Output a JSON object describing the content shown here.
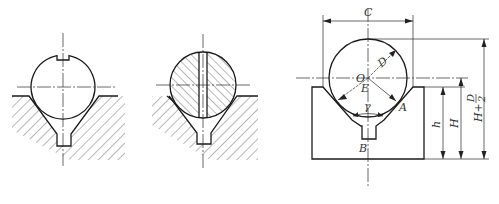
{
  "figure": {
    "views": [
      {
        "id": "view-1",
        "description": "Ball with top notch seated in V-groove fixture (hatched)"
      },
      {
        "id": "view-2",
        "description": "Sectioned ball with vertical slot seated in V-groove fixture (hatched)"
      },
      {
        "id": "view-3",
        "description": "Ball in V-block with dimensions"
      }
    ],
    "labels": {
      "C": "C",
      "D": "D",
      "O": "O",
      "E": "E",
      "gamma": "γ",
      "A": "A",
      "B": "B",
      "h": "h",
      "H": "H",
      "H_plus": "H+",
      "D_num": "D",
      "two": "2"
    }
  }
}
